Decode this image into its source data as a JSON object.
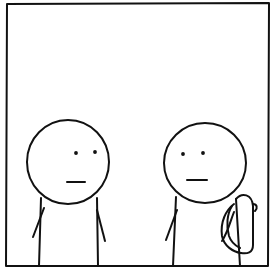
{
  "comic_panel": {
    "description": "Single comic panel, two stick figures facing each other with blank expressions",
    "colors": {
      "background": "#ffffff",
      "ink": "#111111"
    },
    "frame": {
      "x": 6,
      "y": 3,
      "width": 264,
      "height": 263
    },
    "characters": [
      {
        "id": "left-figure",
        "head": {
          "cx": 68,
          "cy": 162,
          "r": 41
        },
        "expression": "neutral",
        "accessory": "none"
      },
      {
        "id": "right-figure",
        "head": {
          "cx": 205,
          "cy": 163,
          "r": 41
        },
        "expression": "neutral",
        "accessory": "backpack"
      }
    ],
    "dialogue": []
  }
}
